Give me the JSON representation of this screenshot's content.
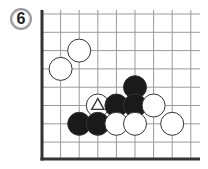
{
  "problem": {
    "number": "6"
  },
  "board": {
    "columns": 9,
    "rows": 8,
    "origin_x": 42,
    "origin_y": 14,
    "spacing_x": 18.6,
    "spacing_y": 18.3,
    "right_x": 200,
    "bottom_y": 159,
    "top_y": 10,
    "edges": [
      "left",
      "bottom"
    ],
    "line_color": "#9a9a9a",
    "edge_color": "#333333",
    "stone_radius": 11.5
  },
  "stones": [
    {
      "color": "white",
      "col": 2,
      "row": 2,
      "marker": ""
    },
    {
      "color": "white",
      "col": 1,
      "row": 3,
      "marker": ""
    },
    {
      "color": "black",
      "col": 5,
      "row": 4,
      "marker": ""
    },
    {
      "color": "white",
      "col": 3,
      "row": 5,
      "marker": "triangle"
    },
    {
      "color": "black",
      "col": 4,
      "row": 5,
      "marker": ""
    },
    {
      "color": "black",
      "col": 5,
      "row": 5,
      "marker": ""
    },
    {
      "color": "white",
      "col": 6,
      "row": 5,
      "marker": ""
    },
    {
      "color": "black",
      "col": 2,
      "row": 6,
      "marker": ""
    },
    {
      "color": "black",
      "col": 3,
      "row": 6,
      "marker": ""
    },
    {
      "color": "white",
      "col": 4,
      "row": 6,
      "marker": ""
    },
    {
      "color": "white",
      "col": 5,
      "row": 6,
      "marker": ""
    },
    {
      "color": "white",
      "col": 7,
      "row": 6,
      "marker": ""
    }
  ],
  "colors": {
    "black_stone": "#1a1a1a",
    "white_stone": "#ffffff",
    "stone_outline": "#333333"
  }
}
